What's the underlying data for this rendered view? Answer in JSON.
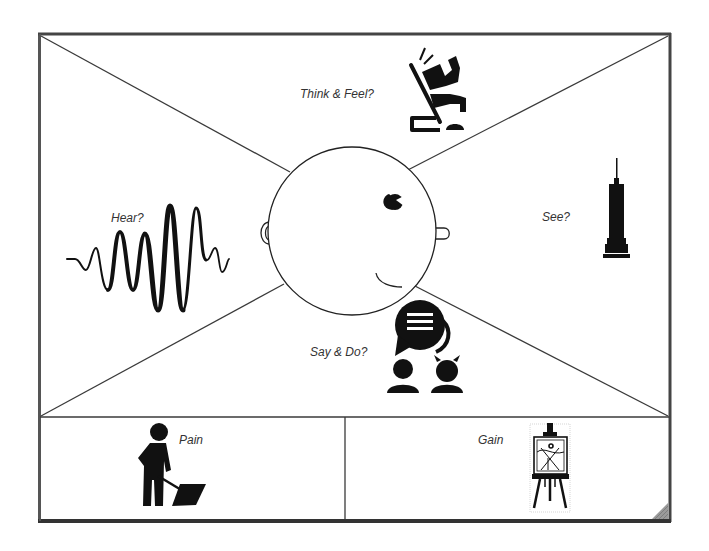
{
  "diagram": {
    "type": "empathy-map",
    "colors": {
      "line": "#3a3a3a",
      "frame": "#4a4a4a",
      "icon": "#111111",
      "text": "#333333",
      "background": "#ffffff"
    },
    "quadrants": {
      "think_feel": {
        "label": "Think & Feel?",
        "icon": "thinker-icon"
      },
      "hear": {
        "label": "Hear?",
        "icon": "sound-wave-icon"
      },
      "see": {
        "label": "See?",
        "icon": "skyscraper-icon"
      },
      "say_do": {
        "label": "Say & Do?",
        "icon": "speech-bubble-people-icon"
      }
    },
    "bottom_panels": {
      "pain": {
        "label": "Pain",
        "icon": "person-shoveling-icon"
      },
      "gain": {
        "label": "Gain",
        "icon": "easel-icon"
      }
    },
    "center": {
      "icon": "face-head-icon"
    }
  }
}
